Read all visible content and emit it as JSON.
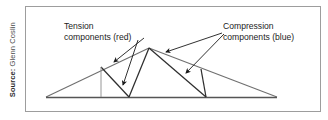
{
  "figure": {
    "width": 328,
    "height": 120,
    "background": "#ffffff",
    "panel_border_color": "#9d9d9d"
  },
  "source_credit": {
    "label": "Source:",
    "name": " Glenn Coslin",
    "full_text": "Source: Glenn Coslin",
    "orientation": "vertical-left"
  },
  "annotations": {
    "tension": {
      "line1": "Tension",
      "line2": "components (red)",
      "color_word": "red",
      "x": 38,
      "y1": 22,
      "y2": 33
    },
    "compression": {
      "line1": "Compression",
      "line2": "components (blue)",
      "color_word": "blue",
      "x": 197,
      "y1": 22,
      "y2": 33
    }
  },
  "diagram": {
    "type": "truss-structure-schematic",
    "line_color_outer": "#6f6f6f",
    "line_color_inner": "#2e2e2e",
    "baseline_color": "#555555",
    "leader_color": "#1a1a1a",
    "nodes": {
      "left_support": [
        20,
        90
      ],
      "right_support": [
        251,
        90
      ],
      "apex": [
        123,
        41
      ],
      "bottom_mid_left": [
        103,
        90
      ],
      "bottom_mid_right": [
        180,
        90
      ],
      "upper_left_chord_pt": [
        75,
        60
      ],
      "upper_right_chord_pt": [
        175,
        62
      ]
    },
    "members_outer_chord": [
      {
        "from": "left_support",
        "to": "apex",
        "role": "top-left-chord"
      },
      {
        "from": "apex",
        "to": "right_support",
        "role": "top-right-chord"
      },
      {
        "from": "left_support",
        "to": "right_support",
        "role": "bottom-chord"
      }
    ],
    "members_web": [
      {
        "from": "bottom_mid_left",
        "to": "apex",
        "role": "web-diagonal"
      },
      {
        "from": "apex",
        "to": "bottom_mid_right",
        "role": "web-diagonal"
      },
      {
        "from": "bottom_mid_left",
        "to": "upper_left_chord_pt",
        "role": "web-vertical"
      },
      {
        "from": "bottom_mid_right",
        "to": "upper_right_chord_pt",
        "role": "web-diagonal"
      }
    ],
    "leaders": [
      {
        "name": "tension-leader-upper",
        "from": [
          118,
          31
        ],
        "to": [
          88,
          55
        ]
      },
      {
        "name": "tension-leader-lower",
        "from": [
          112,
          33
        ],
        "to": [
          97,
          78
        ]
      },
      {
        "name": "compression-leader-left",
        "from": [
          196,
          26
        ],
        "to": [
          140,
          45
        ]
      },
      {
        "name": "compression-leader-right",
        "from": [
          198,
          27
        ],
        "to": [
          160,
          66
        ]
      }
    ]
  }
}
